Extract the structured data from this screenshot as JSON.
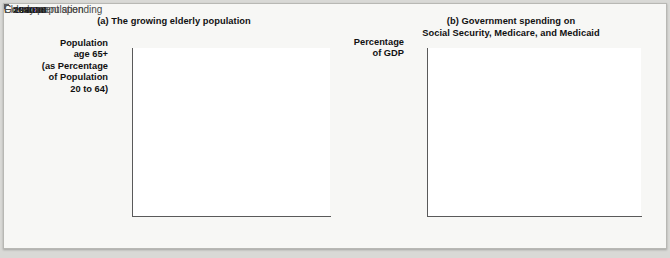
{
  "figure": {
    "background_color": "#f7f7f5",
    "page_color": "#d9d9d6"
  },
  "panel_a": {
    "title": "(a) The growing elderly population",
    "y_axis_label": "Population\nage 65+\n(as Percentage\nof Population\n20 to 64)",
    "y_axis_label_lines": [
      "Population",
      "age 65+",
      "(as Percentage",
      "of Population",
      "20 to 64)"
    ],
    "annotation": "Elderly population",
    "line_color": "#7a7a7a"
  },
  "panel_b": {
    "title_lines": [
      "(b) Government spending on",
      "Social Security, Medicare, and Medicaid"
    ],
    "y_axis_label_lines": [
      "Percentage",
      "of GDP"
    ],
    "annotation": "Government spending",
    "line_color": "#333333"
  },
  "chart_data": [
    {
      "type": "line",
      "id": "panel-a",
      "title": "(a) The growing elderly population",
      "xlabel": "",
      "ylabel": "Population age 65+ (as Percentage of Population 20 to 64)",
      "xlim": [
        1944,
        2072
      ],
      "ylim": [
        10,
        45
      ],
      "xticks": [
        1950,
        1970,
        1990,
        2010,
        2030,
        2050,
        2070
      ],
      "xticklabels": [
        "1950",
        "1970",
        "1990",
        "2010",
        "2030",
        "2050",
        "2070"
      ],
      "yticks": [
        10,
        15,
        20,
        25,
        30,
        35,
        40,
        45
      ],
      "yticklabels": [
        "10",
        "15",
        "20",
        "25",
        "30",
        "35",
        "40",
        "45%"
      ],
      "grid": false,
      "legend": "none",
      "annotations": [
        {
          "text": "Elderly population",
          "x": 2014,
          "y": 21.5,
          "leader_to_x": 2010,
          "leader_to_y": 25.5
        }
      ],
      "series": [
        {
          "name": "Elderly population",
          "color": "#7a7a7a",
          "x": [
            1945,
            1965,
            1990,
            2010,
            2020,
            2030,
            2050,
            2060,
            2072
          ],
          "values": [
            11.5,
            17.3,
            21.0,
            21.5,
            28.5,
            35.8,
            37.3,
            39.0,
            42.2
          ]
        }
      ]
    },
    {
      "type": "line",
      "id": "panel-b",
      "title": "(b) Government spending on Social Security, Medicare, and Medicaid",
      "xlabel": "",
      "ylabel": "Percentage of GDP",
      "xlim": [
        1948,
        2072
      ],
      "ylim": [
        0,
        20
      ],
      "xticks": [
        1950,
        1970,
        1990,
        2010,
        2030,
        2050,
        2070
      ],
      "xticklabels": [
        "1950",
        "1970",
        "1990",
        "2010",
        "2030",
        "2050",
        "2070"
      ],
      "yticks": [
        0,
        5,
        10,
        15,
        20
      ],
      "yticklabels": [
        "0",
        "5",
        "10",
        "15",
        "20%"
      ],
      "grid": false,
      "legend": "none",
      "annotations": [
        {
          "text": "Government spending",
          "x": 2013,
          "y": 6.3,
          "leader_to_x": 2007,
          "leader_to_y": 8.2
        }
      ],
      "series": [
        {
          "name": "Government spending",
          "color": "#333333",
          "x": [
            1950,
            1965,
            1985,
            1995,
            2002,
            2010,
            2020,
            2030,
            2040,
            2050,
            2060,
            2070
          ],
          "values": [
            0.1,
            3.2,
            6.0,
            6.8,
            7.4,
            8.7,
            11.5,
            14.0,
            15.5,
            17.0,
            18.2,
            20.0
          ]
        }
      ]
    }
  ]
}
